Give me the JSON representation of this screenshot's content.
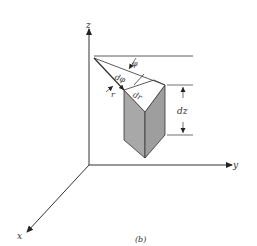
{
  "figure": {
    "caption": "(b)",
    "axes": {
      "x": "x",
      "y": "y",
      "z": "z"
    },
    "labels": {
      "phi": "φ",
      "dphi": "dφ",
      "r": "r",
      "dr": "dr",
      "dz": "dz"
    },
    "colors": {
      "line": "#333333",
      "shade": "#a8a8a8",
      "shade_dark": "#999999",
      "background": "#ffffff"
    }
  }
}
